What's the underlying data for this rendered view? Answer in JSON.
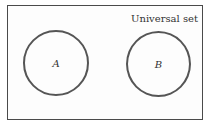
{
  "diagram": {
    "type": "venn",
    "universal_label": "Universal set",
    "sets": [
      {
        "label": "A"
      },
      {
        "label": "B"
      }
    ],
    "relationship": "disjoint"
  }
}
